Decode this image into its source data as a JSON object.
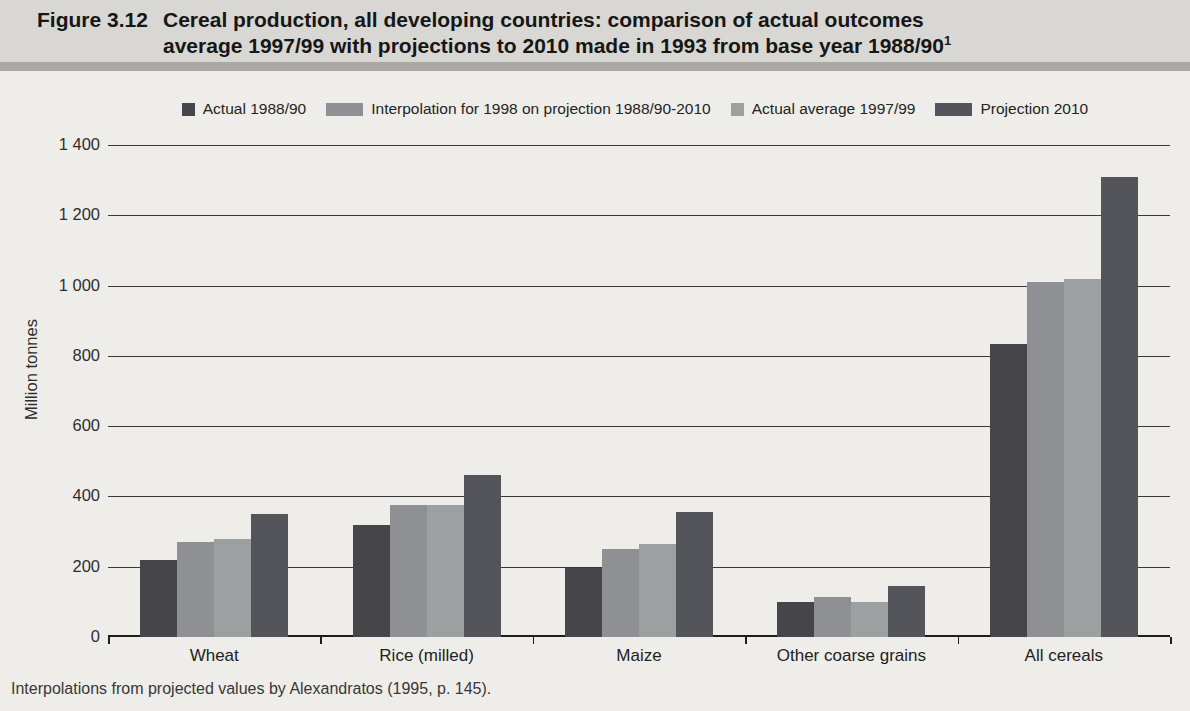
{
  "figure": {
    "label": "Figure 3.12",
    "title_line1": "Cereal production, all developing countries: comparison of actual outcomes",
    "title_line2": "average 1997/99 with projections to 2010 made in 1993 from base year 1988/90",
    "title_superscript": "1"
  },
  "caption": "Interpolations from projected values by Alexandratos (1995, p. 145).",
  "colors": {
    "page_background": "#efede9",
    "header_background": "#d8d7d3",
    "separator": "#aaa9a5",
    "gridline": "#39393a",
    "text": "#222222"
  },
  "chart_data": {
    "type": "bar",
    "title": "Cereal production, all developing countries: comparison of actual outcomes average 1997/99 with projections to 2010 made in 1993 from base year 1988/90",
    "xlabel": "",
    "ylabel": "Million tonnes",
    "ylim": [
      0,
      1400
    ],
    "grid": true,
    "legend_position": "top",
    "ytick_values": [
      0,
      200,
      400,
      600,
      800,
      1000,
      1200,
      1400
    ],
    "ytick_labels": [
      "0",
      "200",
      "400",
      "600",
      "800",
      "1 000",
      "1 200",
      "1 400"
    ],
    "categories": [
      "Wheat",
      "Rice (milled)",
      "Maize",
      "Other coarse grains",
      "All cereals"
    ],
    "series": [
      {
        "name": "Actual 1988/90",
        "color": "#45454a",
        "textured": false,
        "values": [
          220,
          320,
          195,
          100,
          835
        ]
      },
      {
        "name": "Interpolation for 1998 on projection 1988/90-2010",
        "color": "#8f9093",
        "textured": true,
        "values": [
          270,
          375,
          250,
          115,
          1010
        ]
      },
      {
        "name": "Actual average 1997/99",
        "color": "#9da0a1",
        "textured": false,
        "values": [
          280,
          375,
          265,
          100,
          1020
        ]
      },
      {
        "name": "Projection 2010",
        "color": "#54555b",
        "textured": true,
        "values": [
          350,
          460,
          355,
          145,
          1310
        ]
      }
    ]
  }
}
